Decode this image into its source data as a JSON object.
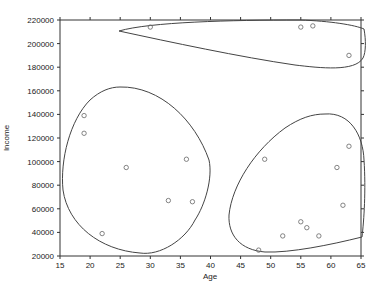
{
  "chart_data": {
    "type": "scatter",
    "title": "",
    "xlabel": "Age",
    "ylabel": "Income",
    "xlim": [
      15,
      65
    ],
    "ylim": [
      20000,
      220000
    ],
    "x_ticks": [
      "15",
      "20",
      "25",
      "30",
      "35",
      "40",
      "45",
      "50",
      "55",
      "60",
      "65"
    ],
    "y_ticks": [
      "20000",
      "40000",
      "60000",
      "80000",
      "100000",
      "120000",
      "140000",
      "160000",
      "180000",
      "200000",
      "220000"
    ],
    "grid": false,
    "legend": null,
    "series": [
      {
        "name": "cluster-high-income",
        "points": [
          {
            "x": 30,
            "y": 214000
          },
          {
            "x": 55,
            "y": 214000
          },
          {
            "x": 57,
            "y": 215000
          },
          {
            "x": 63,
            "y": 190000
          }
        ]
      },
      {
        "name": "cluster-young",
        "points": [
          {
            "x": 19,
            "y": 139000
          },
          {
            "x": 19,
            "y": 124000
          },
          {
            "x": 26,
            "y": 95000
          },
          {
            "x": 36,
            "y": 102000
          },
          {
            "x": 33,
            "y": 67000
          },
          {
            "x": 37,
            "y": 66000
          },
          {
            "x": 22,
            "y": 39000
          }
        ]
      },
      {
        "name": "cluster-older",
        "points": [
          {
            "x": 49,
            "y": 102000
          },
          {
            "x": 63,
            "y": 113000
          },
          {
            "x": 61,
            "y": 95000
          },
          {
            "x": 62,
            "y": 63000
          },
          {
            "x": 55,
            "y": 49000
          },
          {
            "x": 56,
            "y": 44000
          },
          {
            "x": 52,
            "y": 37000
          },
          {
            "x": 58,
            "y": 37000
          },
          {
            "x": 48,
            "y": 25000
          }
        ]
      }
    ],
    "annotations": [
      "Three closed boundary contours enclose each cluster"
    ]
  }
}
